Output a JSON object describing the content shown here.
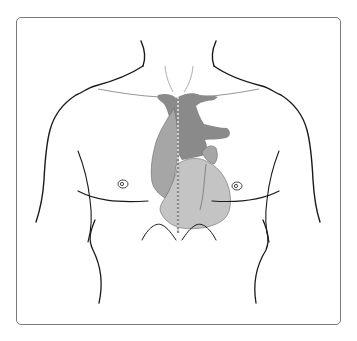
{
  "figure": {
    "colors": {
      "outline": "#1a1a1a",
      "frame_border": "#7a7a7a",
      "great_vessels": "#8a8a8a",
      "atria": "#a6a6a6",
      "ventricles": "#c4c4c4",
      "midline": "#ffffff",
      "background": "#ffffff"
    },
    "parts": [
      "neck",
      "shoulders",
      "clavicles",
      "pectorals",
      "nipples",
      "heart",
      "great-vessels",
      "midline",
      "ribcage-arch",
      "flanks"
    ]
  }
}
